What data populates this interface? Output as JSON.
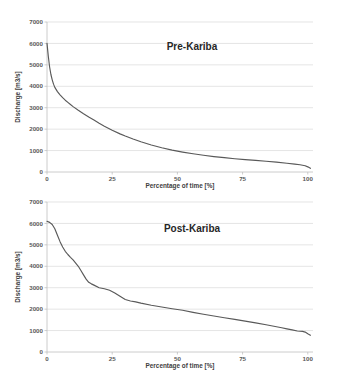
{
  "figure": {
    "background_color": "#ffffff",
    "curve_color": "#595959",
    "grid_color": "#d9d9d9"
  },
  "chart_data": [
    {
      "type": "line",
      "title": "Pre-Kariba",
      "xlabel": "Percentage of time [%]",
      "ylabel": "Discharge [m3/s]",
      "xlim": [
        0,
        102
      ],
      "ylim": [
        0,
        7000
      ],
      "xticks": [
        0,
        25,
        50,
        75,
        100
      ],
      "xtick_labels": [
        "0",
        "25",
        "50",
        "75",
        "100"
      ],
      "yticks": [
        0,
        1000,
        2000,
        3000,
        4000,
        5000,
        6000,
        7000
      ],
      "ytick_labels": [
        "0",
        "1000",
        "2000",
        "3000",
        "4000",
        "5000",
        "6000",
        "7000"
      ],
      "grid": true,
      "legend": false,
      "x": [
        0,
        0.5,
        1,
        1.5,
        2,
        2.5,
        3,
        4,
        5,
        6,
        7,
        8,
        9,
        10,
        12,
        14,
        16,
        18,
        20,
        22,
        25,
        28,
        30,
        33,
        36,
        40,
        44,
        48,
        52,
        56,
        60,
        64,
        68,
        72,
        76,
        80,
        84,
        88,
        92,
        95,
        97,
        99,
        100,
        101
      ],
      "y": [
        6000,
        5400,
        4900,
        4550,
        4300,
        4100,
        3950,
        3750,
        3600,
        3470,
        3350,
        3250,
        3150,
        3050,
        2880,
        2720,
        2570,
        2430,
        2280,
        2140,
        1950,
        1780,
        1680,
        1540,
        1410,
        1260,
        1130,
        1020,
        930,
        850,
        780,
        720,
        670,
        620,
        580,
        540,
        500,
        460,
        410,
        370,
        340,
        290,
        240,
        170
      ]
    },
    {
      "type": "line",
      "title": "Post-Kariba",
      "xlabel": "Percentage of time [%]",
      "ylabel": "Discharge [m3/s]",
      "xlim": [
        0,
        102
      ],
      "ylim": [
        0,
        7000
      ],
      "xticks": [
        0,
        25,
        50,
        75,
        100
      ],
      "xtick_labels": [
        "0",
        "25",
        "50",
        "75",
        "100"
      ],
      "yticks": [
        0,
        1000,
        2000,
        3000,
        4000,
        5000,
        6000,
        7000
      ],
      "ytick_labels": [
        "0",
        "1000",
        "2000",
        "3000",
        "4000",
        "5000",
        "6000",
        "7000"
      ],
      "grid": true,
      "legend": false,
      "x": [
        0,
        1,
        2,
        3,
        4,
        5,
        6,
        7,
        8,
        9,
        10,
        11,
        12,
        13,
        14,
        15,
        16,
        17,
        18,
        20,
        22,
        24,
        26,
        28,
        30,
        32,
        34,
        36,
        40,
        44,
        48,
        52,
        56,
        60,
        64,
        68,
        72,
        76,
        80,
        84,
        88,
        90,
        92,
        94,
        96,
        98,
        99,
        100,
        101
      ],
      "y": [
        6100,
        6050,
        5950,
        5750,
        5450,
        5150,
        4900,
        4700,
        4550,
        4420,
        4300,
        4150,
        4000,
        3800,
        3600,
        3400,
        3250,
        3180,
        3120,
        3000,
        2950,
        2880,
        2750,
        2600,
        2450,
        2380,
        2340,
        2280,
        2180,
        2100,
        2020,
        1950,
        1850,
        1760,
        1680,
        1600,
        1520,
        1440,
        1360,
        1270,
        1180,
        1130,
        1080,
        1030,
        980,
        960,
        930,
        850,
        780
      ]
    }
  ]
}
